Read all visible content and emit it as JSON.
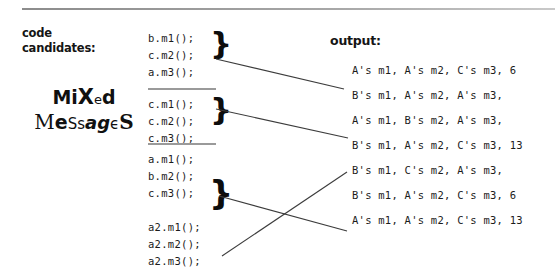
{
  "figure": {
    "left_label_line1": "code",
    "left_label_line2": "candidates:",
    "title_line1": "Mixed",
    "title_line2": "Messages",
    "output_heading": "output:"
  },
  "code_blocks": [
    {
      "id": "block-1",
      "lines": [
        "b.m1();",
        "c.m2();",
        "a.m3();"
      ],
      "brace": "}"
    },
    {
      "id": "block-2",
      "lines": [
        "c.m1();",
        "c.m2();",
        "c.m3();"
      ],
      "brace": "}"
    },
    {
      "id": "block-3",
      "lines": [
        "a.m1();",
        "b.m2();",
        "c.m3();",
        "",
        "a2.m1();",
        "a2.m2();",
        "a2.m3();"
      ],
      "brace": "}"
    }
  ],
  "outputs": [
    {
      "id": "out-1",
      "text": "A's m1, A's m2, C's m3, 6"
    },
    {
      "id": "out-2",
      "text": "B's m1, A's m2, A's m3,"
    },
    {
      "id": "out-3",
      "text": "A's m1, B's m2, A's m3,"
    },
    {
      "id": "out-4",
      "text": "B's m1, A's m2, C's m3, 13"
    },
    {
      "id": "out-5",
      "text": "B's m1, C's m2, A's m3,"
    },
    {
      "id": "out-6",
      "text": "B's m1, A's m2, C's m3, 6"
    },
    {
      "id": "out-7",
      "text": "A's m1, A's m2, C's m3, 13"
    }
  ],
  "connectors": [
    {
      "id": "wire-block1-to-out2",
      "from": "block-1-brace",
      "to": "out-2"
    },
    {
      "id": "wire-block2-to-out4",
      "from": "block-2-brace",
      "to": "out-4"
    },
    {
      "id": "wire-block3-to-out7",
      "from": "block-3-brace",
      "to": "out-7"
    },
    {
      "id": "wire-block3b-to-out6",
      "from": "block-3-lower",
      "to": "out-6"
    }
  ],
  "colors": {
    "ink": "#1b1b1b",
    "rule": "#9a9a9a",
    "wire": "#3c3c3c",
    "paper": "#ffffff"
  }
}
